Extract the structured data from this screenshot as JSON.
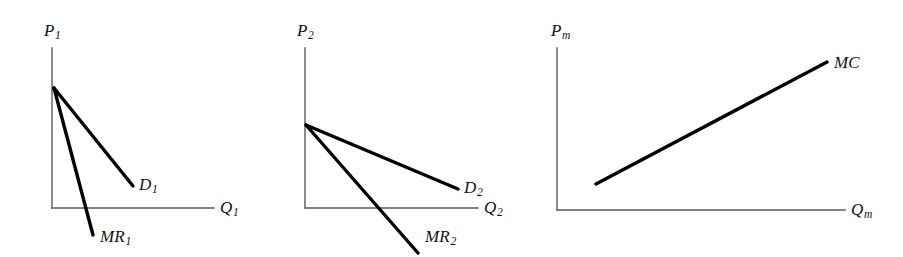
{
  "figure": {
    "background_color": "#ffffff",
    "axis_color": "#5a5a5a",
    "curve_color": "#000000",
    "width": 903,
    "height": 257
  },
  "panels": [
    {
      "id": "panel-1",
      "name": "market-1-demand-and-marginal-revenue",
      "axes": {
        "y_label_base": "P",
        "y_label_sub": "1",
        "x_label_base": "Q",
        "x_label_sub": "1",
        "y_axis": {
          "x": 52,
          "y_top": 48,
          "y_bottom": 208
        },
        "x_axis": {
          "y": 208,
          "x_left": 52,
          "x_right": 214
        }
      },
      "curves": [
        {
          "name": "demand-curve-1",
          "label_base": "D",
          "label_sub": "1",
          "points": [
            [
              54,
              88
            ],
            [
              133,
              186
            ]
          ],
          "label_x": 139,
          "label_y": 176
        },
        {
          "name": "marginal-revenue-curve-1",
          "label_base": "MR",
          "label_sub": "1",
          "points": [
            [
              54,
              88
            ],
            [
              93,
              235
            ]
          ],
          "label_x": 100,
          "label_y": 228
        }
      ],
      "y_label_x": 44,
      "y_label_y": 22,
      "x_label_x": 220,
      "x_label_y": 199
    },
    {
      "id": "panel-2",
      "name": "market-2-demand-and-marginal-revenue",
      "axes": {
        "y_label_base": "P",
        "y_label_sub": "2",
        "x_label_base": "Q",
        "x_label_sub": "2",
        "y_axis": {
          "x": 305,
          "y_top": 48,
          "y_bottom": 208
        },
        "x_axis": {
          "y": 208,
          "x_left": 305,
          "x_right": 478
        }
      },
      "curves": [
        {
          "name": "demand-curve-2",
          "label_base": "D",
          "label_sub": "2",
          "points": [
            [
              306,
              125
            ],
            [
              458,
              189
            ]
          ],
          "label_x": 464,
          "label_y": 179
        },
        {
          "name": "marginal-revenue-curve-2",
          "label_base": "MR",
          "label_sub": "2",
          "points": [
            [
              306,
              125
            ],
            [
              418,
              253
            ]
          ],
          "label_x": 425,
          "label_y": 228
        }
      ],
      "y_label_x": 297,
      "y_label_y": 22,
      "x_label_x": 484,
      "x_label_y": 199
    },
    {
      "id": "panel-3",
      "name": "monopolist-marginal-cost",
      "axes": {
        "y_label_base": "P",
        "y_label_sub": "m",
        "x_label_base": "Q",
        "x_label_sub": "m",
        "y_axis": {
          "x": 557,
          "y_top": 48,
          "y_bottom": 210
        },
        "x_axis": {
          "y": 210,
          "x_left": 557,
          "x_right": 845
        }
      },
      "curves": [
        {
          "name": "marginal-cost-curve",
          "label_base": "MC",
          "label_sub": "",
          "points": [
            [
              596,
              184
            ],
            [
              827,
              62
            ]
          ],
          "label_x": 834,
          "label_y": 54
        }
      ],
      "y_label_x": 551,
      "y_label_y": 22,
      "x_label_x": 851,
      "x_label_y": 201
    }
  ]
}
